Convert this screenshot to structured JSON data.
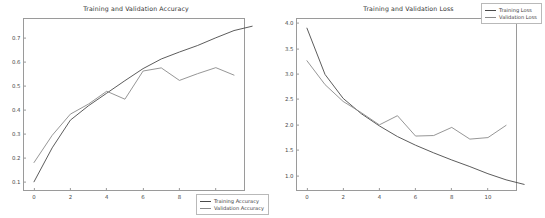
{
  "figure": {
    "width": 545,
    "height": 218,
    "background": "#ffffff",
    "panel_count": 2
  },
  "colors": {
    "train_line": "#4a4a4a",
    "val_line": "#8a8a8a",
    "axis": "#9a9a9a",
    "text": "#3b3b3b"
  },
  "chart_data": [
    {
      "type": "line",
      "title": "Training and Validation Accuracy",
      "xlabel": "",
      "ylabel": "",
      "x": [
        0,
        1,
        2,
        3,
        4,
        5,
        6,
        7,
        8,
        9,
        10,
        11
      ],
      "xlim": [
        -0.55,
        11.55
      ],
      "ylim": [
        0.068,
        0.778
      ],
      "xticks": [
        "0",
        "2",
        "4",
        "6",
        "8",
        "10"
      ],
      "xtick_values": [
        0,
        2,
        4,
        6,
        8,
        10
      ],
      "yticks": [
        "0.1",
        "0.2",
        "0.3",
        "0.4",
        "0.5",
        "0.6",
        "0.7"
      ],
      "ytick_values": [
        0.1,
        0.2,
        0.3,
        0.4,
        0.5,
        0.6,
        0.7
      ],
      "grid": false,
      "legend_position": "lower right",
      "series": [
        {
          "name": "Training Accuracy",
          "color": "#4a4a4a",
          "values": [
            0.102,
            0.243,
            0.358,
            0.418,
            0.47,
            0.522,
            0.572,
            0.612,
            0.641,
            0.668,
            0.7,
            0.73,
            0.748
          ]
        },
        {
          "name": "Validation Accuracy",
          "color": "#8a8a8a",
          "values": [
            0.182,
            0.295,
            0.383,
            0.425,
            0.478,
            0.445,
            0.562,
            0.575,
            0.523,
            0.551,
            0.576,
            0.545
          ]
        }
      ]
    },
    {
      "type": "line",
      "title": "Training and Validation Loss",
      "xlabel": "",
      "ylabel": "",
      "x": [
        0,
        1,
        2,
        3,
        4,
        5,
        6,
        7,
        8,
        9,
        10,
        11
      ],
      "xlim": [
        -0.55,
        11.55
      ],
      "ylim": [
        0.72,
        4.08
      ],
      "xticks": [
        "0",
        "2",
        "4",
        "6",
        "8",
        "10"
      ],
      "xtick_values": [
        0,
        2,
        4,
        6,
        8,
        10
      ],
      "yticks": [
        "1.0",
        "1.5",
        "2.0",
        "2.5",
        "3.0",
        "3.5",
        "4.0"
      ],
      "ytick_values": [
        1.0,
        1.5,
        2.0,
        2.5,
        3.0,
        3.5,
        4.0
      ],
      "grid": false,
      "legend_position": "upper right",
      "series": [
        {
          "name": "Training Loss",
          "color": "#4a4a4a",
          "values": [
            3.9,
            2.99,
            2.52,
            2.22,
            1.98,
            1.77,
            1.6,
            1.45,
            1.31,
            1.18,
            1.04,
            0.92,
            0.83
          ]
        },
        {
          "name": "Validation Loss",
          "color": "#8a8a8a",
          "values": [
            3.26,
            2.79,
            2.46,
            2.24,
            2.0,
            2.18,
            1.78,
            1.79,
            1.95,
            1.72,
            1.75,
            1.99
          ]
        }
      ]
    }
  ],
  "panels": [
    {
      "title": "Training and Validation Accuracy",
      "legend": [
        {
          "label": "Training Accuracy"
        },
        {
          "label": "Validation Accuracy"
        }
      ]
    },
    {
      "title": "Training and Validation Loss",
      "legend": [
        {
          "label": "Training Loss"
        },
        {
          "label": "Validation Loss"
        }
      ]
    }
  ]
}
